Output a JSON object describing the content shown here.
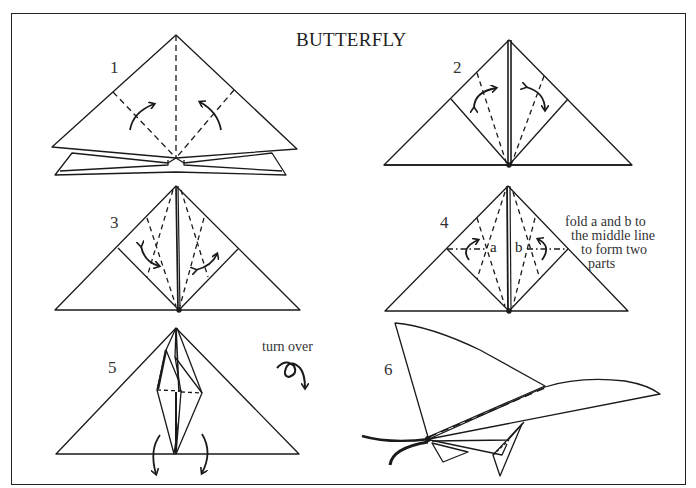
{
  "title": "BUTTERFLY",
  "steps": [
    {
      "number": "1"
    },
    {
      "number": "2"
    },
    {
      "number": "3"
    },
    {
      "number": "4",
      "labels": [
        "a",
        "b"
      ],
      "note_lines": [
        "fold a and b to",
        "the middle line",
        "to form two",
        "parts"
      ]
    },
    {
      "number": "5",
      "note": "turn over"
    },
    {
      "number": "6"
    }
  ],
  "colors": {
    "line": "#1a1a1a",
    "text": "#333333",
    "background": "#ffffff"
  }
}
